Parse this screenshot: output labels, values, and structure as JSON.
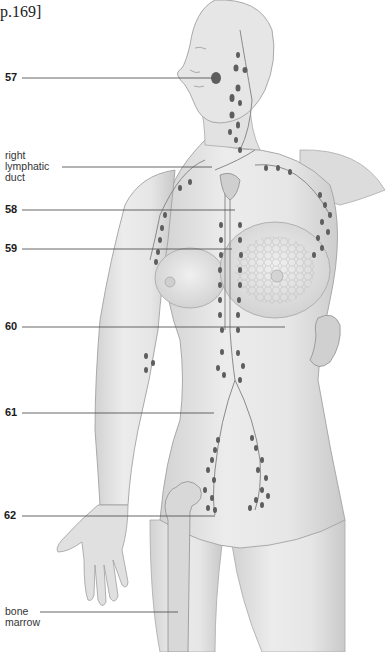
{
  "page_reference": "p.169]",
  "figure": {
    "labels": [
      {
        "id": "57",
        "text": "57",
        "kind": "number"
      },
      {
        "id": "right-lymphatic-duct",
        "text": "right\nlymphatic\nduct",
        "lines": [
          "right",
          "lymphatic",
          "duct"
        ],
        "kind": "term"
      },
      {
        "id": "58",
        "text": "58",
        "kind": "number"
      },
      {
        "id": "59",
        "text": "59",
        "kind": "number"
      },
      {
        "id": "60",
        "text": "60",
        "kind": "number"
      },
      {
        "id": "61",
        "text": "61",
        "kind": "number"
      },
      {
        "id": "62",
        "text": "62",
        "kind": "number"
      },
      {
        "id": "bone-marrow",
        "text": "bone\nmarrow",
        "lines": [
          "bone",
          "marrow"
        ],
        "kind": "term"
      }
    ]
  },
  "colors": {
    "background": "#ffffff",
    "skin": "#e4e4e4",
    "skin_shadow": "#c8c8c8",
    "outline": "#9a9a9a",
    "lymph_node": "#5e5e5e",
    "vessel": "#8a8a8a",
    "leader_line": "#444444",
    "label_text": "#1a1a1a"
  }
}
